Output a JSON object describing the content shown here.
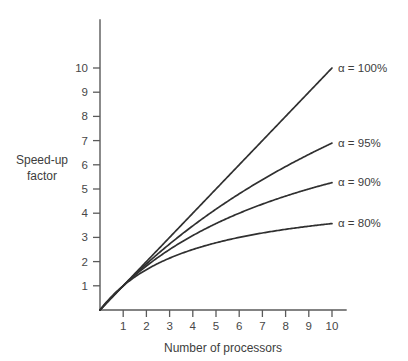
{
  "chart_data": {
    "type": "line",
    "title": "",
    "xlabel": "Number of processors",
    "ylabel_line1": "Speed-up",
    "ylabel_line2": "factor",
    "xlim": [
      0,
      10.6
    ],
    "ylim": [
      0,
      11.6
    ],
    "grid": false,
    "legend_position": "inline-right-of-curve-ends",
    "xticks": [
      1,
      2,
      3,
      4,
      5,
      6,
      7,
      8,
      9,
      10
    ],
    "xtick_labels": [
      "1",
      "2",
      "3",
      "4",
      "5",
      "6",
      "7",
      "8",
      "9",
      "10"
    ],
    "yticks": [
      1,
      2,
      3,
      4,
      5,
      6,
      7,
      8,
      9,
      10
    ],
    "ytick_labels": [
      "1",
      "2",
      "3",
      "4",
      "5",
      "6",
      "7",
      "8",
      "9",
      "10"
    ],
    "x": [
      1,
      2,
      3,
      4,
      5,
      6,
      7,
      8,
      9,
      10
    ],
    "series": [
      {
        "name": "alpha-100",
        "label": "α = 100%",
        "alpha": 100,
        "values": [
          1,
          2,
          3,
          4,
          5,
          6,
          7,
          8,
          9,
          10
        ]
      },
      {
        "name": "alpha-95",
        "label": "α = 95%",
        "alpha": 95,
        "values": [
          1,
          1.9,
          2.73,
          3.48,
          4.17,
          4.8,
          5.39,
          5.93,
          6.43,
          6.9
        ]
      },
      {
        "name": "alpha-90",
        "label": "α = 90%",
        "alpha": 90,
        "values": [
          1,
          1.82,
          2.5,
          3.08,
          3.57,
          4.0,
          4.37,
          4.71,
          5.0,
          5.26
        ]
      },
      {
        "name": "alpha-80",
        "label": "α = 80%",
        "alpha": 80,
        "values": [
          1,
          1.67,
          2.14,
          2.5,
          2.78,
          3.0,
          3.18,
          3.33,
          3.46,
          3.57
        ]
      }
    ],
    "annotations": [
      "α = 100%",
      "α = 95%",
      "α = 90%",
      "α = 80%"
    ],
    "colors": {
      "background": "#ffffff",
      "axis": "#5a5a5a",
      "curve": "#303030",
      "text": "#3d3d3d"
    }
  }
}
